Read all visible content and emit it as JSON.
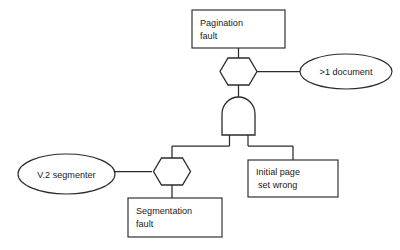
{
  "diagram": {
    "type": "fault-tree",
    "background_color": "#ffffff",
    "stroke_color": "#2b2b2b",
    "text_color": "#1a1a1a",
    "nodes": {
      "pagination_fault": {
        "label_line1": "Pagination",
        "label_line2": "fault",
        "shape": "rectangle"
      },
      "more_than_one_document": {
        "label": ">1 document",
        "shape": "ellipse"
      },
      "initial_page_set_wrong": {
        "label_line1": "Initial page",
        "label_line2": "set wrong",
        "shape": "rectangle"
      },
      "v2_segmenter": {
        "label": "V.2 segmenter",
        "shape": "ellipse"
      },
      "segmentation_fault": {
        "label_line1": "Segmentation",
        "label_line2": "fault",
        "shape": "rectangle"
      }
    },
    "gates": {
      "inhibit_gate_top": {
        "kind": "inhibit",
        "shape": "hexagon"
      },
      "and_gate": {
        "kind": "and",
        "shape": "and-gate"
      },
      "inhibit_gate_bottom": {
        "kind": "inhibit",
        "shape": "hexagon"
      }
    }
  }
}
